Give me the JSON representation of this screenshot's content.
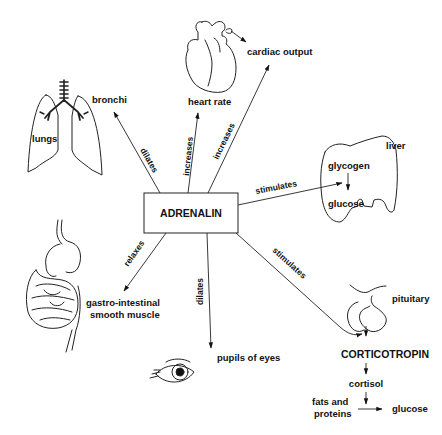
{
  "diagram": {
    "center": {
      "label": "ADRENALIN"
    },
    "nodes": {
      "bronchi": "bronchi",
      "lungs": "lungs",
      "heart_rate": "heart rate",
      "cardiac_output": "cardiac output",
      "liver": "liver",
      "glycogen": "glycogen",
      "glucose_liver": "glucose",
      "gi": [
        "gastro-intestinal",
        "smooth muscle"
      ],
      "pupils": "pupils of eyes",
      "pituitary": "pituitary",
      "corticotropin": "CORTICOTROPIN",
      "cortisol": "cortisol",
      "fats": [
        "fats and",
        "proteins"
      ],
      "glucose_final": "glucose"
    },
    "edges": {
      "dilates_bronchi": "dilates",
      "increases_hr": "increases",
      "increases_co": "increases",
      "stimulates_liver": "stimulates",
      "relaxes_gi": "relaxes",
      "dilates_pupils": "dilates",
      "stimulates_pituitary": "stimulates"
    }
  }
}
